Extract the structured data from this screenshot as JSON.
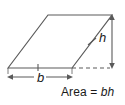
{
  "figure": {
    "type": "parallelogram-area-diagram",
    "background_color": "#ffffff",
    "stroke_color": "#5a5a5a",
    "text_color": "#1a1a1a"
  },
  "shape": {
    "name": "parallelogram",
    "vertices": [
      {
        "name": "bottom-left",
        "x": 8,
        "y": 68
      },
      {
        "name": "top-left",
        "x": 48,
        "y": 15
      },
      {
        "name": "top-right",
        "x": 112,
        "y": 15
      },
      {
        "name": "bottom-right",
        "x": 72,
        "y": 68
      }
    ],
    "tick_marks": [
      {
        "name": "base-tick",
        "edge": "bottom"
      },
      {
        "name": "right-side-tick",
        "edge": "right-slant"
      }
    ]
  },
  "labels": {
    "height": "h",
    "base": "b",
    "area_prefix": "Area =",
    "area_variables": "bh",
    "area_full": "Area = bh"
  },
  "annotations": {
    "height_line": {
      "name": "height-measure",
      "x": 112,
      "y_top": 15,
      "y_bottom": 68,
      "arrows": "both"
    },
    "base_line": {
      "name": "base-measure",
      "y": 77,
      "x_left": 8,
      "x_right": 72,
      "arrows": "both"
    },
    "dashed_extension": {
      "name": "baseline-extension",
      "x_start": 72,
      "x_end": 112,
      "y": 68,
      "style": "dashed"
    }
  }
}
